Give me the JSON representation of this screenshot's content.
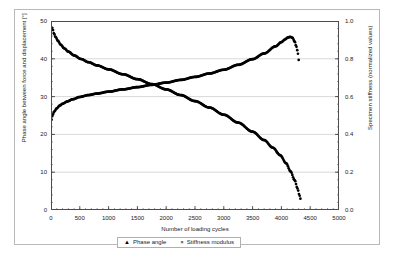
{
  "chart_data": {
    "type": "line",
    "title": "",
    "xlabel": "Number of loading cycles",
    "ylabel": "Phase angle between force and displacement [°]",
    "ylabel_right": "Specimen stiffness (normalized values)",
    "xlim": [
      0,
      5000
    ],
    "ylim": [
      0,
      50
    ],
    "ylim_right": [
      0.0,
      1.0
    ],
    "xticks": [
      0,
      500,
      1000,
      1500,
      2000,
      2500,
      3000,
      3500,
      4000,
      4500,
      5000
    ],
    "xtick_labels": [
      "0",
      "500",
      "1000",
      "1500",
      "2000",
      "2500",
      "3000",
      "3500",
      "4000",
      "4500",
      "5000"
    ],
    "yticks_left": [
      0,
      10,
      20,
      30,
      40,
      50
    ],
    "ytick_labels_left": [
      "0",
      "10",
      "20",
      "30",
      "40",
      "50"
    ],
    "yticks_right": [
      0.0,
      0.2,
      0.4,
      0.6,
      0.8,
      1.0
    ],
    "ytick_labels_right": [
      "0.0",
      "0.2",
      "0.4",
      "0.6",
      "0.8",
      "1.0"
    ],
    "grid": "horizontal",
    "legend_position": "bottom",
    "minor_tick_interval_x": 100,
    "series": [
      {
        "name": "Phase angle",
        "marker": "triangle",
        "axis": "left",
        "color": "#000000",
        "x": [
          10,
          30,
          60,
          100,
          150,
          200,
          280,
          380,
          500,
          650,
          800,
          1000,
          1250,
          1500,
          1750,
          2000,
          2250,
          2500,
          2750,
          3000,
          3250,
          3500,
          3700,
          3900,
          4000,
          4060,
          4110,
          4150,
          4190,
          4230,
          4260,
          4290,
          4300
        ],
        "y": [
          23.9,
          25.2,
          26.1,
          26.9,
          27.6,
          28.1,
          28.7,
          29.3,
          29.9,
          30.4,
          30.8,
          31.3,
          31.9,
          32.5,
          33.1,
          33.7,
          34.4,
          35.2,
          36.1,
          37.1,
          38.4,
          39.9,
          41.4,
          43.3,
          44.4,
          45.1,
          45.6,
          45.8,
          45.6,
          44.6,
          43.2,
          41.3,
          39.7
        ]
      },
      {
        "name": "Stiffness modulus",
        "marker": "cross",
        "axis": "right",
        "color": "#000000",
        "x": [
          10,
          25,
          50,
          80,
          120,
          170,
          230,
          300,
          400,
          520,
          650,
          800,
          1000,
          1250,
          1500,
          1750,
          2000,
          2250,
          2500,
          2750,
          3000,
          3250,
          3500,
          3700,
          3850,
          3980,
          4080,
          4160,
          4230,
          4280,
          4310,
          4330
        ],
        "y": [
          1.0,
          0.962,
          0.935,
          0.915,
          0.895,
          0.874,
          0.855,
          0.838,
          0.818,
          0.799,
          0.782,
          0.765,
          0.744,
          0.718,
          0.692,
          0.666,
          0.638,
          0.608,
          0.576,
          0.542,
          0.504,
          0.462,
          0.414,
          0.37,
          0.33,
          0.29,
          0.248,
          0.204,
          0.158,
          0.114,
          0.082,
          0.06
        ]
      }
    ]
  },
  "legend": {
    "entries": [
      {
        "marker": "▲",
        "label": "Phase angle"
      },
      {
        "marker": "×",
        "label": "Stiffness modulus"
      }
    ]
  }
}
